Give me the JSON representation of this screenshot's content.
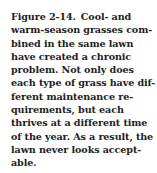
{
  "caption": {
    "figure_label": "Figure 2-14.",
    "lines": [
      "Cool- and",
      "warm-season grasses com-",
      "bined in the same lawn",
      "have created a chronic",
      "problem. Not only does",
      "each type of grass have dif-",
      "ferent maintenance re-",
      "quirements, but each",
      "thrives at a different time",
      "of the year. As a result, the",
      "lawn never looks accept-",
      "able."
    ],
    "text_color": "#222222"
  }
}
